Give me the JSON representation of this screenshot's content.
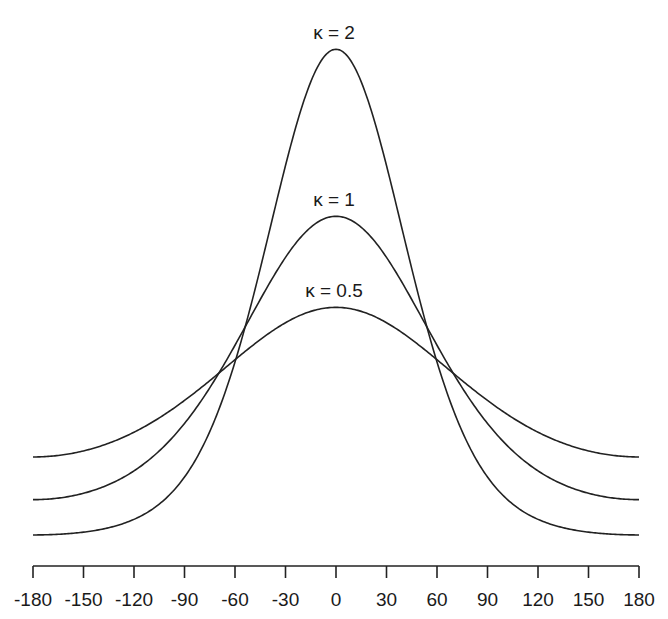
{
  "chart_data": {
    "type": "line",
    "title": "",
    "xlabel": "",
    "ylabel": "",
    "x_ticks": [
      -180,
      -150,
      -120,
      -90,
      -60,
      -30,
      0,
      30,
      60,
      90,
      120,
      150,
      180
    ],
    "x_tick_labels": [
      "-180",
      "-150",
      "-120",
      "-90",
      "-60",
      "-30",
      "0",
      "30",
      "60",
      "90",
      "120",
      "150",
      "180"
    ],
    "xlim": [
      -180,
      180
    ],
    "ylim": [
      0,
      0.55
    ],
    "y_axis_visible": false,
    "grid": false,
    "legend": "inline labels above curve peaks",
    "function": "von Mises density f(theta) = exp(kappa*cos(theta)) / (2*pi*I0(kappa))",
    "series": [
      {
        "name": "κ = 2",
        "kappa": 2,
        "peak": 0.516,
        "trough": 0.0095,
        "x": [
          -180,
          -150,
          -120,
          -90,
          -60,
          -30,
          0,
          30,
          60,
          90,
          120,
          150,
          180
        ],
        "values": [
          0.0095,
          0.0123,
          0.0257,
          0.0698,
          0.1898,
          0.3935,
          0.516,
          0.3935,
          0.1898,
          0.0698,
          0.0257,
          0.0123,
          0.0095
        ]
      },
      {
        "name": "κ = 1",
        "kappa": 1,
        "peak": 0.3417,
        "trough": 0.0462,
        "x": [
          -180,
          -150,
          -120,
          -90,
          -60,
          -30,
          0,
          30,
          60,
          90,
          120,
          150,
          180
        ],
        "values": [
          0.0462,
          0.0529,
          0.0762,
          0.1257,
          0.2073,
          0.3001,
          0.3417,
          0.3001,
          0.2073,
          0.1257,
          0.0762,
          0.0529,
          0.0462
        ]
      },
      {
        "name": "κ = 0.5",
        "kappa": 0.5,
        "peak": 0.2467,
        "trough": 0.0908,
        "x": [
          -180,
          -150,
          -120,
          -90,
          -60,
          -30,
          0,
          30,
          60,
          90,
          120,
          150,
          180
        ],
        "values": [
          0.0908,
          0.0971,
          0.1166,
          0.1497,
          0.1922,
          0.2312,
          0.2467,
          0.2312,
          0.1922,
          0.1497,
          0.1166,
          0.0971,
          0.0908
        ]
      }
    ],
    "labels": [
      {
        "text": "κ = 2",
        "series": 0
      },
      {
        "text": "κ = 1",
        "series": 1
      },
      {
        "text": "κ = 0.5",
        "series": 2
      }
    ]
  },
  "layout": {
    "x_px_left": 33,
    "x_px_right": 639,
    "axis_y_px": 566,
    "tick_len_px": 12,
    "y_zero_px": 544,
    "px_per_unit": 959,
    "line_color": "#222222",
    "background": "#ffffff"
  }
}
